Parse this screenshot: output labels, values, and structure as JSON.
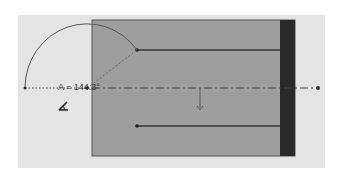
{
  "sketch": {
    "angle_label": "A = 144.3°",
    "angle_icon": "angle-dimension-icon",
    "colors": {
      "canvas": "#e4e4e4",
      "body": "#9e9e9e",
      "end_cap": "#2a2a2a",
      "lines": "#3a3a3a"
    }
  }
}
